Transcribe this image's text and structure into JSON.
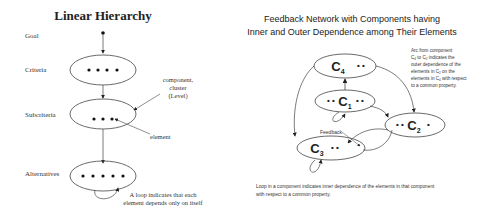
{
  "left": {
    "title": "Linear Hierarchy",
    "levels": [
      {
        "label": "Goal",
        "elements": 1
      },
      {
        "label": "Criteria",
        "elements": 4
      },
      {
        "label": "Subcriteria",
        "elements": 3
      },
      {
        "label": "Alternatives",
        "elements": 5
      }
    ],
    "annotations": {
      "component_line1": "component,",
      "component_line2": "cluster",
      "component_line3": "(Level)",
      "element": "element",
      "loop_line1": "A loop indicates that each",
      "loop_line2": "element depends only on itself"
    }
  },
  "right": {
    "title_line1": "Feedback Network with Components having",
    "title_line2": "Inner and Outer Dependence among Their Elements",
    "components": [
      {
        "name": "C",
        "sub": "4"
      },
      {
        "name": "C",
        "sub": "1"
      },
      {
        "name": "C",
        "sub": "2"
      },
      {
        "name": "C",
        "sub": "3"
      }
    ],
    "feedback_label": "Feedback",
    "arc_note": {
      "line1": "Arc from component",
      "line2_a": "C",
      "line2_a_sub": "4",
      "line2_b": " to C",
      "line2_b_sub": "2",
      "line2_c": " indicates the",
      "line3": "outer dependence of the",
      "line4_a": "elements in C",
      "line4_sub": "2",
      "line4_b": " on the",
      "line5_a": "elements in C",
      "line5_sub": "4",
      "line5_b": " with respect",
      "line6": "to a common property."
    },
    "loop_note_line1": "Loop in a component indicates inner dependence of the elements in that component",
    "loop_note_line2": "with respect to a common property."
  }
}
